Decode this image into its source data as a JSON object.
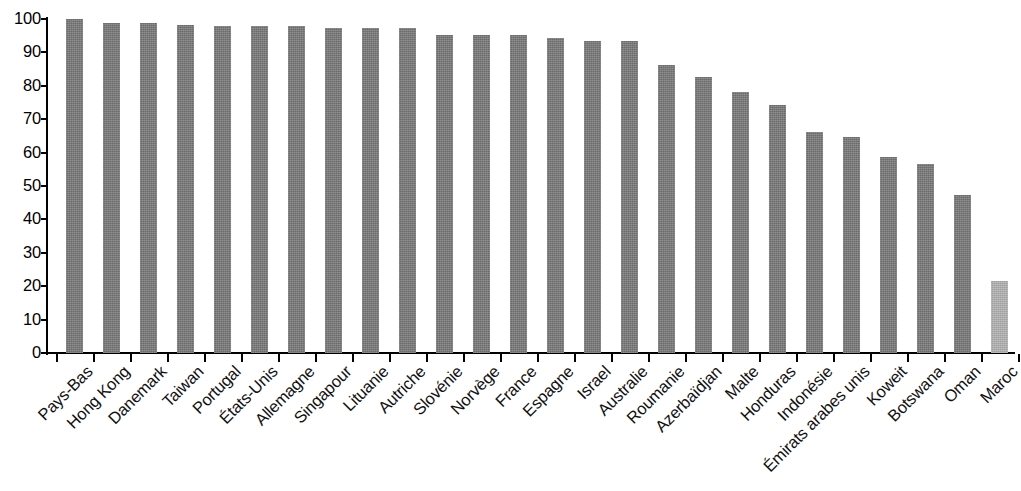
{
  "chart_data": {
    "type": "bar",
    "title": "",
    "subtitle": "",
    "xlabel": "",
    "ylabel": "",
    "ylim": [
      0,
      100
    ],
    "yticks": [
      0,
      10,
      20,
      30,
      40,
      50,
      60,
      70,
      80,
      90,
      100
    ],
    "grid": false,
    "legend": null,
    "bar_color": "#787878",
    "highlight_color": "#b2b2b2",
    "highlight_category": "Maroc",
    "categories": [
      "Pays-Bas",
      "Hong Kong",
      "Danemark",
      "Taiwan",
      "Portugal",
      "États-Unis",
      "Allemagne",
      "Singapour",
      "Lituanie",
      "Autriche",
      "Slovénie",
      "Norvège",
      "France",
      "Espagne",
      "Israel",
      "Australie",
      "Roumanie",
      "Azerbaïdjan",
      "Malte",
      "Honduras",
      "Indonésie",
      "Émirats arabes unis",
      "Koweit",
      "Botswana",
      "Oman",
      "Maroc"
    ],
    "values": [
      100.0,
      98.8,
      98.8,
      98.1,
      98.0,
      98.0,
      98.0,
      97.2,
      97.2,
      97.2,
      95.3,
      95.3,
      95.3,
      94.3,
      93.5,
      93.5,
      86.2,
      82.6,
      78.1,
      74.3,
      66.2,
      64.7,
      58.7,
      56.6,
      47.3,
      21.6
    ]
  }
}
